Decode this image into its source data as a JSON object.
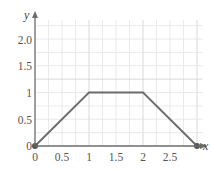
{
  "chart_data": {
    "type": "line",
    "title": "",
    "xlabel": "x",
    "ylabel": "y",
    "x": [
      0,
      1,
      2,
      3
    ],
    "series": [
      {
        "name": "f(x)",
        "values": [
          0,
          1,
          1,
          0
        ]
      }
    ],
    "xlim": [
      0,
      3.1
    ],
    "ylim": [
      0,
      2.25
    ],
    "x_ticks": [
      0,
      0.5,
      1,
      1.5,
      2,
      2.5
    ],
    "x_tick_labels": [
      "0",
      "0.5",
      "1",
      "1.5",
      "2",
      "2.5"
    ],
    "y_ticks": [
      0,
      0.5,
      1,
      1.5,
      2.0
    ],
    "y_tick_labels": [
      "0",
      "0.5",
      "1",
      "1.5",
      "2.0"
    ],
    "grid": true,
    "grid_step": 0.25,
    "endpoints_marked": true,
    "colors": {
      "line": "#6b6b6b",
      "axis": "#6b6b6b",
      "grid": "#e4e4e4",
      "grid_major": "#cfcfcf"
    }
  },
  "axes": {
    "x_label": "x",
    "y_label": "y",
    "x_tick_labels": [
      "0",
      "0.5",
      "1",
      "1.5",
      "2",
      "2.5"
    ],
    "y_tick_labels": [
      "0",
      "0.5",
      "1",
      "1.5",
      "2.0"
    ]
  }
}
